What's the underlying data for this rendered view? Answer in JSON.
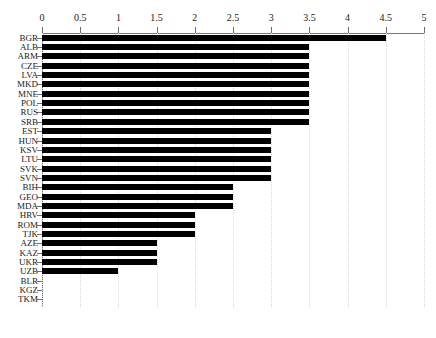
{
  "chart_data": {
    "type": "bar",
    "orientation": "horizontal",
    "title": "",
    "subtitle": "",
    "xlabel": "",
    "ylabel": "",
    "xlim": [
      0,
      5
    ],
    "ylim": null,
    "grid": true,
    "grid_axis": "x",
    "grid_style": "dotted",
    "legend": false,
    "legend_position": "none",
    "axis_position": "top",
    "bar_color": "#000000",
    "categories": [
      "BGR",
      "ALB",
      "ARM",
      "CZE",
      "LVA",
      "MKD",
      "MNE",
      "POL",
      "RUS",
      "SRB",
      "EST",
      "HUN",
      "KSV",
      "LTU",
      "SVK",
      "SVN",
      "BIH",
      "GEO",
      "MDA",
      "HRV",
      "ROM",
      "TJK",
      "AZE",
      "KAZ",
      "UKR",
      "UZB",
      "BLR",
      "KGZ",
      "TKM"
    ],
    "values": [
      4.5,
      3.5,
      3.5,
      3.5,
      3.5,
      3.5,
      3.5,
      3.5,
      3.5,
      3.5,
      3.0,
      3.0,
      3.0,
      3.0,
      3.0,
      3.0,
      2.5,
      2.5,
      2.5,
      2.0,
      2.0,
      2.0,
      1.5,
      1.5,
      1.5,
      1.0,
      0,
      0,
      0
    ],
    "xticks": [
      0,
      0.5,
      1,
      1.5,
      2,
      2.5,
      3,
      3.5,
      4,
      4.5,
      5
    ],
    "xticklabels": [
      "0",
      "0.5",
      "1",
      "1.5",
      "2",
      "2.5",
      "3",
      "3.5",
      "4",
      "4.5",
      "5"
    ]
  },
  "colors": {
    "bar": "#000000",
    "grid": "#d9d9d9",
    "axis": "#6f6f6f",
    "text": "#1a1a1a",
    "background": "#ffffff"
  }
}
